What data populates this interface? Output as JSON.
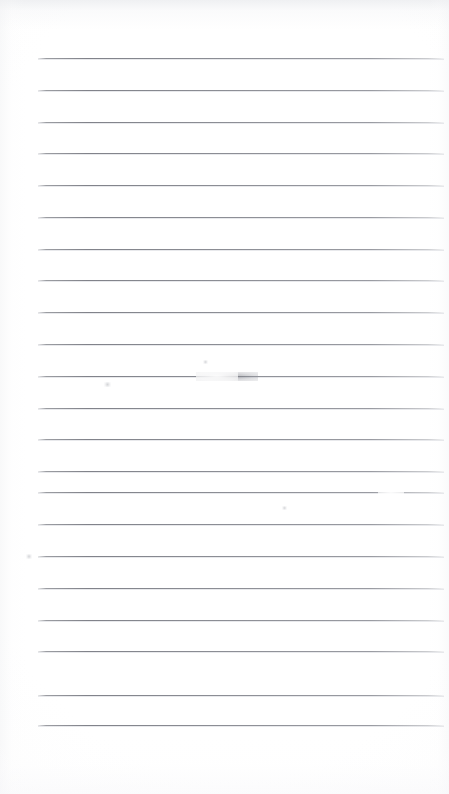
{
  "document": {
    "kind": "scanned-blank-lined-page",
    "title": "Blank Lined Page",
    "page_width": 449,
    "page_height": 794,
    "background_color": "#ffffff",
    "has_text_content": false,
    "written_content": "",
    "handwriting_present": false,
    "margin_header_note": "",
    "margin_footer_note": ""
  },
  "ruling": {
    "line_color": "#7b7d85",
    "line_halo_color": "#cdcfd4",
    "line_thickness_px": 1,
    "line_count": 22,
    "line_left_x": 38,
    "line_right_x": 444,
    "line_width_px": 406,
    "first_line_y": 58,
    "last_line_y": 725,
    "line_spacing_px": 31.8,
    "top_margin_px": 58,
    "bottom_margin_px": 69,
    "left_margin_px": 38,
    "right_margin_px": 5,
    "has_vertical_margin_rule": false,
    "has_holes": false,
    "line_positions_y": [
      58,
      90,
      122,
      153,
      185,
      217,
      249,
      280,
      312,
      344,
      376,
      408,
      439,
      471,
      492,
      524,
      556,
      588,
      620,
      651,
      695,
      725
    ],
    "line_labels": [
      "ruled-line-1",
      "ruled-line-2",
      "ruled-line-3",
      "ruled-line-4",
      "ruled-line-5",
      "ruled-line-6",
      "ruled-line-7",
      "ruled-line-8",
      "ruled-line-9",
      "ruled-line-10",
      "ruled-line-11",
      "ruled-line-12",
      "ruled-line-13",
      "ruled-line-14",
      "ruled-line-15",
      "ruled-line-16",
      "ruled-line-17",
      "ruled-line-18",
      "ruled-line-19",
      "ruled-line-20",
      "ruled-line-21",
      "ruled-line-22"
    ]
  },
  "artifacts": [
    {
      "name": "smudge-mark-upper",
      "type": "smudge",
      "x": 196,
      "y": 372,
      "width": 62,
      "height": 9,
      "color": "#6c6e76",
      "description": "faint darkened thickening on the ruled line"
    },
    {
      "name": "highlight-gap-upper",
      "type": "highlight",
      "x": 196,
      "y": 371,
      "width": 42,
      "height": 10,
      "color": "#ffffff",
      "description": "bright scan washout interrupting the ruled line"
    },
    {
      "name": "line-break-right",
      "type": "highlight",
      "x": 378,
      "y": 488,
      "width": 26,
      "height": 9,
      "color": "#ffffff",
      "description": "small break in the ruled line toward the right edge"
    },
    {
      "name": "speck-upper-left",
      "type": "speck",
      "x": 104,
      "y": 382,
      "width": 7,
      "height": 5,
      "color": "#aaacb2",
      "description": "tiny dust speck"
    },
    {
      "name": "speck-mid",
      "type": "speck",
      "x": 203,
      "y": 360,
      "width": 5,
      "height": 4,
      "color": "#aaacb2",
      "description": "tiny dust speck"
    },
    {
      "name": "speck-right",
      "type": "speck",
      "x": 282,
      "y": 506,
      "width": 5,
      "height": 4,
      "color": "#aaacb2",
      "description": "tiny dust speck"
    },
    {
      "name": "speck-lower-left",
      "type": "speck",
      "x": 26,
      "y": 554,
      "width": 6,
      "height": 5,
      "color": "#aaacb2",
      "description": "tiny dust speck"
    }
  ]
}
